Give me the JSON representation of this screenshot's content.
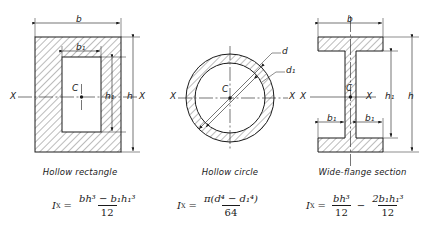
{
  "page": {
    "background": "#ffffff",
    "line_color": "#1a1a1a",
    "hatch_color": "#555555"
  },
  "figures": [
    {
      "id": "hollow-rectangle",
      "caption": "Hollow rectangle",
      "dimension_labels": {
        "width_outer": "b",
        "width_inner": "b₁",
        "height_outer": "h",
        "height_inner": "h₁"
      },
      "axis_label_left": "X",
      "axis_label_right": "X",
      "centroid_label": "C",
      "formula": {
        "lhs": "I",
        "lhs_sub": "X",
        "equals": "=",
        "numerator": "bh³ − b₁h₁³",
        "denominator": "12"
      }
    },
    {
      "id": "hollow-circle",
      "caption": "Hollow circle",
      "dimension_labels": {
        "diameter_outer": "d",
        "diameter_inner": "d₁"
      },
      "axis_label_left": "X",
      "axis_label_right": "X",
      "centroid_label": "C",
      "formula": {
        "lhs": "I",
        "lhs_sub": "X",
        "equals": "=",
        "numerator": "π(d⁴ − d₁⁴)",
        "denominator": "64"
      }
    },
    {
      "id": "wide-flange-section",
      "caption": "Wide-flange section",
      "dimension_labels": {
        "width_outer": "b",
        "width_inner_left": "b₁",
        "width_inner_right": "b₁",
        "height_outer": "h",
        "height_inner": "h₁"
      },
      "axis_label_left": "X",
      "axis_label_right": "X",
      "centroid_label": "C",
      "formula": {
        "lhs": "I",
        "lhs_sub": "X",
        "equals": "=",
        "term1_numerator": "bh³",
        "term1_denominator": "12",
        "operator": "−",
        "term2_numerator": "2b₁h₁³",
        "term2_denominator": "12"
      }
    }
  ]
}
